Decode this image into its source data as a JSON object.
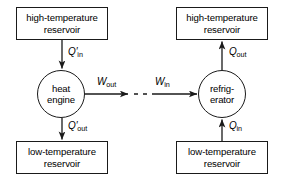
{
  "diagram": {
    "stroke_color": "#1a1a1a",
    "background_color": "#ffffff",
    "left_system": {
      "hot_reservoir": {
        "line1": "high-temperature",
        "line2": "reservoir"
      },
      "device": {
        "line1": "heat",
        "line2": "engine"
      },
      "cold_reservoir": {
        "line1": "low-temperature",
        "line2": "reservoir"
      },
      "heat_in": {
        "symbol": "Q",
        "prime": "′",
        "subscript": "in"
      },
      "heat_out": {
        "symbol": "Q",
        "prime": "′",
        "subscript": "out"
      },
      "work": {
        "symbol": "W",
        "prime": "",
        "subscript": "out"
      }
    },
    "right_system": {
      "hot_reservoir": {
        "line1": "high-temperature",
        "line2": "reservoir"
      },
      "device": {
        "line1": "refrig-",
        "line2": "erator"
      },
      "cold_reservoir": {
        "line1": "low-temperature",
        "line2": "reservoir"
      },
      "heat_out": {
        "symbol": "Q",
        "prime": "",
        "subscript": "out"
      },
      "heat_in": {
        "symbol": "Q",
        "prime": "",
        "subscript": "in"
      },
      "work": {
        "symbol": "W",
        "prime": "",
        "subscript": "in"
      }
    },
    "connector": {
      "style": "dashed",
      "name": "work-coupling-dashes"
    }
  }
}
